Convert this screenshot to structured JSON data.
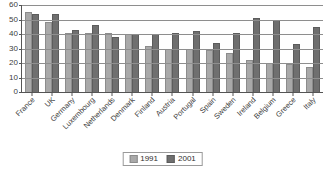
{
  "chart_data": {
    "type": "bar",
    "title": "",
    "subtitle": "",
    "xlabel": "",
    "ylabel": "",
    "ylim": [
      0,
      60
    ],
    "ytick_step": 10,
    "yticks": [
      "0",
      "10",
      "20",
      "30",
      "40",
      "50",
      "60"
    ],
    "grid": true,
    "legend_position": "bottom-center",
    "categories": [
      "France",
      "UK",
      "Germany",
      "Luxembourg",
      "Netherlands",
      "Denmark",
      "Finland",
      "Austria",
      "Portugal",
      "Spain",
      "Sweden",
      "Ireland",
      "Belgium",
      "Greece",
      "Italy"
    ],
    "series": [
      {
        "name": "1991",
        "color": "#a9a9a9",
        "values": [
          55,
          48,
          41,
          41,
          41,
          40,
          32,
          30,
          30,
          29,
          27,
          22,
          20,
          19,
          17
        ]
      },
      {
        "name": "2001",
        "color": "#6f6f6f",
        "values": [
          54,
          54,
          43,
          46,
          38,
          40,
          40,
          41,
          42,
          34,
          41,
          51,
          50,
          33,
          45
        ]
      }
    ]
  },
  "legend": {
    "items": [
      {
        "label": "1991",
        "color": "#a9a9a9"
      },
      {
        "label": "2001",
        "color": "#6f6f6f"
      }
    ]
  },
  "colors": {
    "series_1991": "#a9a9a9",
    "series_2001": "#6f6f6f",
    "gridline": "#8e8e8e",
    "axis": "#555555",
    "text": "#3d3d3d",
    "background": "#ffffff"
  }
}
